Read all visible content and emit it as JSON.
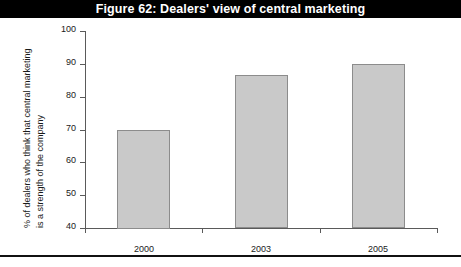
{
  "figure": {
    "title": "Figure 62: Dealers' view of central marketing",
    "title_bar_color": "#000000",
    "title_text_color": "#ffffff",
    "bottom_rule_color": "#111111"
  },
  "axis": {
    "ylabel_line1": "% of dealers who think that central marketing",
    "ylabel_line2": "is a strength of the company",
    "ytick_labels": [
      "100",
      "90",
      "80",
      "70",
      "60",
      "50",
      "40"
    ],
    "xtick_labels": [
      "2000",
      "2003",
      "2005"
    ]
  },
  "chart_data": {
    "type": "bar",
    "title": "Figure 62: Dealers' view of central marketing",
    "categories": [
      "2000",
      "2003",
      "2005"
    ],
    "values": [
      70,
      86.5,
      90
    ],
    "xlabel": "",
    "ylabel": "% of dealers who think that central marketing is a strength of the company",
    "ylim": [
      40,
      100
    ],
    "ytick_values": [
      100,
      90,
      80,
      70,
      60,
      50,
      40
    ],
    "ystep": 10,
    "grid": false,
    "legend": null,
    "bar_fill_color": "#c9c9c9",
    "bar_border_color": "#8c8c8c",
    "axis_color": "#5a5a5a"
  }
}
